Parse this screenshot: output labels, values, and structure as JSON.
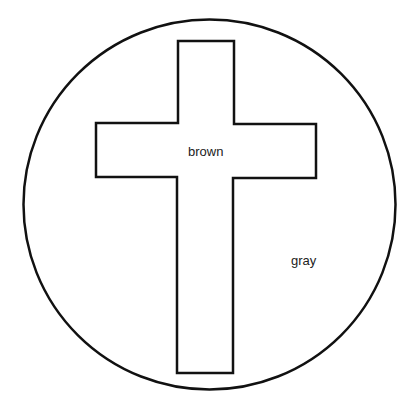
{
  "diagram": {
    "type": "color-by-label outline",
    "shapes": {
      "circle": {
        "label": "gray",
        "stroke_color": "#111111"
      },
      "cross": {
        "label": "brown",
        "stroke_color": "#111111"
      }
    },
    "labels": [
      {
        "region": "cross",
        "text": "brown"
      },
      {
        "region": "circle-background",
        "text": "gray"
      }
    ]
  }
}
